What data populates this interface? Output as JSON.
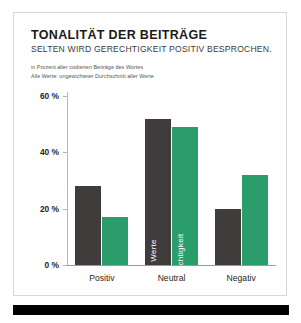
{
  "card": {
    "title": "TONALITÄT DER BEITRÄGE",
    "subtitle": "SELTEN WIRD GERECHTIGKEIT POSITIV BESPROCHEN.",
    "note_line_1": "in Prozent aller codierten Beiträge des Wortes",
    "note_line_2": "Alle Werte: ungewichteter Durchschnitt aller Werte"
  },
  "colors": {
    "dark_series": "#403c3c",
    "green_series": "#2a9d6a",
    "axis": "#9a9a9a",
    "text": "#1f1f1f",
    "bottom_bar": "#000000",
    "card_border": "#d8d8d8"
  },
  "chart_data": {
    "type": "bar",
    "title": "TONALITÄT DER BEITRÄGE",
    "subtitle": "SELTEN WIRD GERECHTIGKEIT POSITIV BESPROCHEN.",
    "xlabel": "",
    "ylabel": "",
    "ylim": [
      0,
      60
    ],
    "yticks": [
      0,
      20,
      40,
      60
    ],
    "ytick_labels": [
      "0 %",
      "20 %",
      "40 %",
      "60 %"
    ],
    "grid": false,
    "legend_position": "in-bar",
    "categories": [
      "Positiv",
      "Neutral",
      "Negativ"
    ],
    "series": [
      {
        "name": "Alle Werte",
        "color": "#403c3c",
        "values": [
          28,
          52,
          20
        ]
      },
      {
        "name": "Gerechtigkeit",
        "color": "#2a9d6a",
        "values": [
          17,
          49,
          32
        ]
      }
    ],
    "inbar_labels": {
      "dark": "Alle Werte",
      "green": "Gerechtigkeit"
    }
  }
}
